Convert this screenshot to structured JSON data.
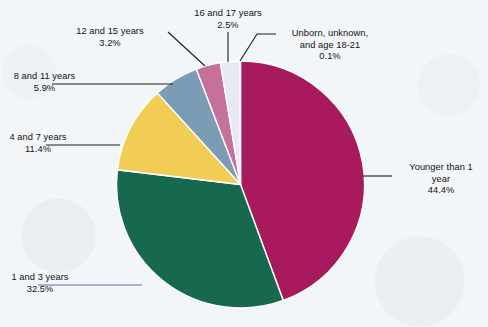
{
  "chart_data": {
    "type": "pie",
    "title": "",
    "subtitle": "",
    "xlabel": "",
    "ylabel": "",
    "legend_position": "callout-labels",
    "grid": false,
    "start_angle_deg": 0,
    "direction": "clockwise",
    "categories": [
      "Younger than 1 year",
      "1 and 3 years",
      "4 and 7 years",
      "8 and 11 years",
      "12 and 15 years",
      "16 and 17 years",
      "Unborn, unknown, and age 18-21"
    ],
    "values": [
      44.4,
      32.5,
      11.4,
      5.9,
      3.2,
      2.5,
      0.1
    ],
    "value_labels": [
      "44.4%",
      "32.5%",
      "11.4%",
      "5.9%",
      "3.2%",
      "2.5%",
      "0.1%"
    ],
    "colors": [
      "#a9195e",
      "#16694f",
      "#f2cd55",
      "#7c9cb6",
      "#c5719b",
      "#e7eaf2",
      "#dfe4ee"
    ],
    "units": "percent"
  },
  "slices": [
    {
      "name": "younger-than-1",
      "label_line1": "Younger than 1",
      "label_line2": "year",
      "percent": "44.4%",
      "color": "#a9195e"
    },
    {
      "name": "one-and-three",
      "label_line1": "1 and 3 years",
      "label_line2": "",
      "percent": "32.5%",
      "color": "#16694f"
    },
    {
      "name": "four-and-seven",
      "label_line1": "4 and 7 years",
      "label_line2": "",
      "percent": "11.4%",
      "color": "#f2cd55"
    },
    {
      "name": "eight-and-eleven",
      "label_line1": "8 and 11 years",
      "label_line2": "",
      "percent": "5.9%",
      "color": "#7c9cb6"
    },
    {
      "name": "twelve-and-fifteen",
      "label_line1": "12 and 15 years",
      "label_line2": "",
      "percent": "3.2%",
      "color": "#c5719b"
    },
    {
      "name": "sixteen-and-seventeen",
      "label_line1": "16 and 17 years",
      "label_line2": "",
      "percent": "2.5%",
      "color": "#e7eaf2"
    },
    {
      "name": "unborn-unknown",
      "label_line1": "Unborn, unknown,",
      "label_line2": "and age 18-21",
      "percent": "0.1%",
      "color": "#dfe4ee"
    }
  ],
  "style": {
    "background": "#f3f6f8",
    "text_color": "#111111",
    "leader_color": "#1d1d1d",
    "leader_color_accent": "#6b6bc0"
  }
}
